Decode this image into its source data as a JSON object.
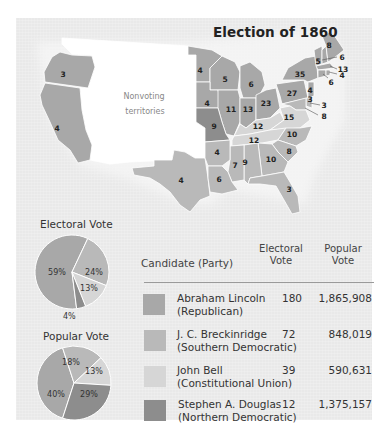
{
  "title": "Election of 1860",
  "colors": {
    "lincoln": "#a8a8a8",
    "breckinridge": "#b9b9b9",
    "bell": "#d6d6d6",
    "douglas": "#8d8d8d",
    "territory": "#ffffff",
    "background": "#e9e9e9"
  },
  "map": {
    "territory_label_line1": "Nonvoting",
    "territory_label_line2": "territories",
    "states": [
      {
        "abbr": "OR",
        "votes": "3",
        "winner": "lincoln"
      },
      {
        "abbr": "CA",
        "votes": "4",
        "winner": "lincoln"
      },
      {
        "abbr": "TX",
        "votes": "4",
        "winner": "breckinridge"
      },
      {
        "abbr": "MN",
        "votes": "4",
        "winner": "lincoln"
      },
      {
        "abbr": "WI",
        "votes": "5",
        "winner": "lincoln"
      },
      {
        "abbr": "MI",
        "votes": "6",
        "winner": "lincoln"
      },
      {
        "abbr": "IA",
        "votes": "4",
        "winner": "lincoln"
      },
      {
        "abbr": "IL",
        "votes": "11",
        "winner": "lincoln"
      },
      {
        "abbr": "IN",
        "votes": "13",
        "winner": "lincoln"
      },
      {
        "abbr": "OH",
        "votes": "23",
        "winner": "lincoln"
      },
      {
        "abbr": "PA",
        "votes": "27",
        "winner": "lincoln"
      },
      {
        "abbr": "NY",
        "votes": "35",
        "winner": "lincoln"
      },
      {
        "abbr": "ME",
        "votes": "8",
        "winner": "lincoln"
      },
      {
        "abbr": "VT",
        "votes": "5",
        "winner": "lincoln"
      },
      {
        "abbr": "NH",
        "votes": "5",
        "winner": "lincoln"
      },
      {
        "abbr": "MA",
        "votes": "13",
        "winner": "lincoln"
      },
      {
        "abbr": "RI",
        "votes": "4",
        "winner": "lincoln"
      },
      {
        "abbr": "CT",
        "votes": "6",
        "winner": "lincoln"
      },
      {
        "abbr": "NJ",
        "votes": "4",
        "winner": "lincoln"
      },
      {
        "abbr": "DE",
        "votes": "3",
        "winner": "breckinridge"
      },
      {
        "abbr": "MD",
        "votes": "8",
        "winner": "breckinridge"
      },
      {
        "abbr": "MD2",
        "votes": "3",
        "winner": "breckinridge"
      },
      {
        "abbr": "MO",
        "votes": "9",
        "winner": "douglas"
      },
      {
        "abbr": "KY",
        "votes": "12",
        "winner": "bell"
      },
      {
        "abbr": "VA",
        "votes": "15",
        "winner": "bell"
      },
      {
        "abbr": "TN",
        "votes": "12",
        "winner": "bell"
      },
      {
        "abbr": "NC",
        "votes": "10",
        "winner": "breckinridge"
      },
      {
        "abbr": "SC",
        "votes": "8",
        "winner": "breckinridge"
      },
      {
        "abbr": "GA",
        "votes": "10",
        "winner": "breckinridge"
      },
      {
        "abbr": "AL",
        "votes": "9",
        "winner": "breckinridge"
      },
      {
        "abbr": "MS",
        "votes": "7",
        "winner": "breckinridge"
      },
      {
        "abbr": "AR",
        "votes": "4",
        "winner": "breckinridge"
      },
      {
        "abbr": "LA",
        "votes": "6",
        "winner": "breckinridge"
      },
      {
        "abbr": "FL",
        "votes": "3",
        "winner": "breckinridge"
      }
    ],
    "callouts": [
      "6",
      "13",
      "4",
      "6",
      "3",
      "8"
    ]
  },
  "electoral_pie": {
    "title": "Electoral Vote",
    "slices": [
      {
        "candidate": "lincoln",
        "percent": 59,
        "label": "59%"
      },
      {
        "candidate": "breckinridge",
        "percent": 24,
        "label": "24%"
      },
      {
        "candidate": "bell",
        "percent": 13,
        "label": "13%"
      },
      {
        "candidate": "douglas",
        "percent": 4,
        "label": "4%"
      }
    ]
  },
  "popular_pie": {
    "title": "Popular Vote",
    "slices": [
      {
        "candidate": "lincoln",
        "percent": 40,
        "label": "40%"
      },
      {
        "candidate": "breckinridge",
        "percent": 18,
        "label": "18%"
      },
      {
        "candidate": "bell",
        "percent": 13,
        "label": "13%"
      },
      {
        "candidate": "douglas",
        "percent": 29,
        "label": "29%"
      }
    ]
  },
  "table": {
    "headers": {
      "candidate": "Candidate (Party)",
      "electoral_1": "Electoral",
      "electoral_2": "Vote",
      "popular_1": "Popular",
      "popular_2": "Vote"
    },
    "rows": [
      {
        "name": "Abraham Lincoln",
        "party": "(Republican)",
        "electoral": "180",
        "popular": "1,865,908",
        "color_key": "lincoln"
      },
      {
        "name": "J. C. Breckinridge",
        "party": "(Southern Democratic)",
        "electoral": "72",
        "popular": "848,019",
        "color_key": "breckinridge"
      },
      {
        "name": "John Bell",
        "party": "(Constitutional Union)",
        "electoral": "39",
        "popular": "590,631",
        "color_key": "bell"
      },
      {
        "name": "Stephen A. Douglas",
        "party": "(Northern Democratic)",
        "electoral": "12",
        "popular": "1,375,157",
        "color_key": "douglas"
      }
    ]
  },
  "chart_data": [
    {
      "type": "pie",
      "title": "Electoral Vote",
      "categories": [
        "Abraham Lincoln (Republican)",
        "J. C. Breckinridge (Southern Democratic)",
        "John Bell (Constitutional Union)",
        "Stephen A. Douglas (Northern Democratic)"
      ],
      "values": [
        59,
        24,
        13,
        4
      ]
    },
    {
      "type": "pie",
      "title": "Popular Vote",
      "categories": [
        "Abraham Lincoln (Republican)",
        "J. C. Breckinridge (Southern Democratic)",
        "John Bell (Constitutional Union)",
        "Stephen A. Douglas (Northern Democratic)"
      ],
      "values": [
        40,
        18,
        13,
        29
      ]
    },
    {
      "type": "table",
      "title": "Election of 1860",
      "columns": [
        "Candidate (Party)",
        "Electoral Vote",
        "Popular Vote"
      ],
      "rows": [
        [
          "Abraham Lincoln (Republican)",
          180,
          1865908
        ],
        [
          "J. C. Breckinridge (Southern Democratic)",
          72,
          848019
        ],
        [
          "John Bell (Constitutional Union)",
          39,
          590631
        ],
        [
          "Stephen A. Douglas (Northern Democratic)",
          12,
          1375157
        ]
      ]
    }
  ]
}
